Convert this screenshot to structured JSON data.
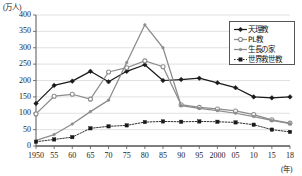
{
  "chart_data": {
    "type": "line",
    "title": "",
    "xlabel": "(年)",
    "ylabel": "(万人)",
    "ylim": [
      0,
      400
    ],
    "ytick_labels": [
      "0",
      "50",
      "100",
      "150",
      "200",
      "250",
      "300",
      "350",
      "400"
    ],
    "yticks": [
      0,
      50,
      100,
      150,
      200,
      250,
      300,
      350,
      400
    ],
    "grid": true,
    "legend_position": "top-right",
    "categories": [
      "1950",
      "55",
      "60",
      "65",
      "70",
      "75",
      "80",
      "85",
      "90",
      "95",
      "2000",
      "05",
      "10",
      "15",
      "18"
    ],
    "x": [
      1950,
      1955,
      1960,
      1965,
      1970,
      1975,
      1980,
      1985,
      1990,
      1995,
      2000,
      2005,
      2010,
      2015,
      2018
    ],
    "series": [
      {
        "name": "天理教",
        "color": "#1a1a1a",
        "marker": "filled-diamond",
        "values": [
          130,
          185,
          198,
          228,
          196,
          228,
          248,
          200,
          203,
          207,
          193,
          178,
          150,
          147,
          150
        ]
      },
      {
        "name": "PL教",
        "color": "#8c8c8c",
        "marker": "open-circle",
        "values": [
          98,
          152,
          158,
          143,
          226,
          239,
          260,
          242,
          126,
          118,
          113,
          107,
          96,
          80,
          70
        ]
      },
      {
        "name": "生長の家",
        "color": "#8c8c8c",
        "marker": "filled-small",
        "values": [
          17,
          35,
          67,
          105,
          140,
          255,
          370,
          300,
          123,
          115,
          108,
          100,
          90,
          78,
          68
        ]
      },
      {
        "name": "世界救世教",
        "color": "#1a1a1a",
        "marker": "filled-square-dotted",
        "values": [
          13,
          20,
          27,
          54,
          60,
          63,
          73,
          75,
          74,
          75,
          74,
          72,
          65,
          50,
          43
        ]
      }
    ]
  },
  "legend": {
    "items": [
      {
        "label": "天理教"
      },
      {
        "label": "PL教"
      },
      {
        "label": "生長の家"
      },
      {
        "label": "世界救世教"
      }
    ]
  },
  "axes": {
    "y_unit": "(万人)",
    "x_unit": "(年)"
  }
}
